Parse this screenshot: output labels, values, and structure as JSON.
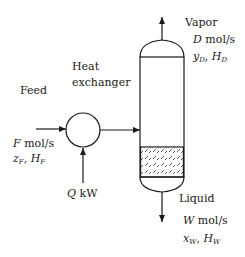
{
  "diagram": {
    "feed": {
      "label": "Feed",
      "flow_var": "F",
      "flow_unit": "mol/s",
      "comp_var": "z",
      "comp_sub": "F",
      "enth_var": "H",
      "enth_sub": "F"
    },
    "heat_exchanger": {
      "label_line1": "Heat",
      "label_line2": "exchanger",
      "duty_var": "Q",
      "duty_unit": "kW"
    },
    "vapor": {
      "label": "Vapor",
      "flow_var": "D",
      "flow_unit": "mol/s",
      "comp_var": "y",
      "comp_sub": "D",
      "enth_var": "H",
      "enth_sub": "D"
    },
    "liquid": {
      "label": "Liquid",
      "flow_var": "W",
      "flow_unit": "mol/s",
      "comp_var": "x",
      "comp_sub": "W",
      "enth_var": "H",
      "enth_sub": "W"
    },
    "colors": {
      "line": "#1a1a1a",
      "background": "#ffffff"
    },
    "separator": ", "
  }
}
